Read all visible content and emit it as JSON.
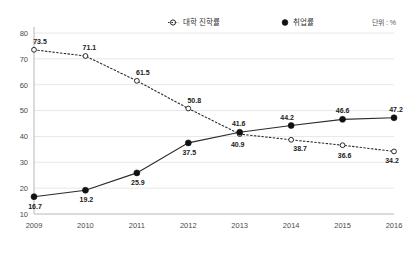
{
  "chart_data": {
    "type": "line",
    "title": "",
    "xlabel": "",
    "ylabel": "",
    "unit_note": "단위 : %",
    "categories": [
      "2009",
      "2010",
      "2011",
      "2012",
      "2013",
      "2014",
      "2015",
      "2016"
    ],
    "ylim": [
      10,
      80
    ],
    "yticks": [
      10,
      20,
      30,
      40,
      50,
      60,
      70,
      80
    ],
    "grid": true,
    "legend_position": "top",
    "series": [
      {
        "name": "대학 진학률",
        "style": "dotted",
        "marker": "open-circle",
        "color": "#2b2b2b",
        "values": [
          73.5,
          71.1,
          61.5,
          50.8,
          40.9,
          38.7,
          36.6,
          34.2
        ]
      },
      {
        "name": "취업률",
        "style": "solid",
        "marker": "filled-circle",
        "color": "#111111",
        "values": [
          16.7,
          19.2,
          25.9,
          37.5,
          41.6,
          44.2,
          46.6,
          47.2
        ]
      }
    ]
  }
}
